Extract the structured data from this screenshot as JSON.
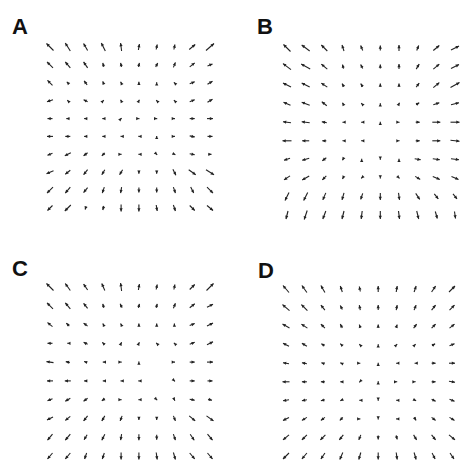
{
  "figure": {
    "panels": [
      {
        "id": "A",
        "label": "A"
      },
      {
        "id": "B",
        "label": "B"
      },
      {
        "id": "C",
        "label": "C"
      },
      {
        "id": "D",
        "label": "D"
      }
    ],
    "arrow_color": "#222222"
  },
  "chart_data": [
    {
      "type": "quiver",
      "title": "A",
      "grid": {
        "rows": 10,
        "cols": 10
      },
      "layout": {
        "label_x": 12,
        "label_y": 16,
        "x0": 50,
        "x1": 210,
        "y0": 47,
        "y1": 208
      },
      "u": [
        [
          -7,
          -5,
          -4,
          -4,
          -1,
          1,
          1,
          1,
          6,
          8
        ],
        [
          -6,
          -5,
          -4,
          -1,
          -1,
          1,
          2,
          2,
          5,
          5
        ],
        [
          -5,
          -2,
          -3,
          -1,
          -1,
          0,
          0,
          -1,
          5,
          5
        ],
        [
          -6,
          -1,
          -4,
          1,
          -1,
          1,
          -1,
          -1,
          5,
          5
        ],
        [
          -5,
          -3,
          -3,
          -2,
          1,
          1,
          1,
          1,
          5,
          6
        ],
        [
          -6,
          -5,
          -3,
          -2,
          -1,
          -1,
          0,
          1,
          5,
          5
        ],
        [
          -5,
          -6,
          -4,
          -3,
          1,
          -1,
          1,
          2,
          5,
          3
        ],
        [
          -7,
          -5,
          -4,
          -3,
          -3,
          0,
          0,
          3,
          7,
          8
        ],
        [
          -6,
          -5,
          -4,
          -2,
          -1,
          0,
          0,
          2,
          3,
          6
        ],
        [
          -5,
          -6,
          -1,
          -1,
          0,
          0,
          1,
          2,
          5,
          6
        ]
      ],
      "v": [
        [
          7,
          8,
          7,
          8,
          8,
          6,
          5,
          5,
          5,
          7
        ],
        [
          6,
          6,
          6,
          4,
          4,
          4,
          4,
          5,
          4,
          2
        ],
        [
          5,
          2,
          4,
          3,
          2,
          2,
          1,
          1,
          2,
          3
        ],
        [
          -2,
          1,
          2,
          1,
          2,
          2,
          1,
          1,
          2,
          3
        ],
        [
          0,
          0,
          0,
          0,
          1,
          0,
          0,
          0,
          0,
          0
        ],
        [
          0,
          0,
          0,
          0,
          0,
          0,
          1,
          0,
          -1,
          0
        ],
        [
          -2,
          -3,
          -3,
          -3,
          0,
          0,
          -1,
          -1,
          -1,
          0
        ],
        [
          -3,
          -4,
          -5,
          -5,
          -5,
          -3,
          -3,
          -6,
          -5,
          -5
        ],
        [
          -6,
          -6,
          -5,
          -6,
          -6,
          -5,
          -5,
          -6,
          -6,
          -6
        ],
        [
          -5,
          -6,
          -3,
          -4,
          -7,
          -7,
          -6,
          -6,
          -5,
          -5
        ]
      ]
    },
    {
      "type": "quiver",
      "title": "B",
      "grid": {
        "rows": 10,
        "cols": 10
      },
      "layout": {
        "label_x": 257,
        "label_y": 16,
        "x0": 287,
        "x1": 455,
        "y0": 48,
        "y1": 215
      },
      "u": [
        [
          -7,
          -8,
          -6,
          -2,
          -2,
          0,
          0,
          2,
          6,
          8
        ],
        [
          -8,
          -9,
          -6,
          -1,
          -2,
          0,
          0,
          3,
          6,
          8
        ],
        [
          -8,
          -8,
          -6,
          -2,
          -2,
          0,
          0,
          3,
          6,
          9
        ],
        [
          -7,
          -8,
          -5,
          -1,
          -1,
          0,
          1,
          3,
          6,
          8
        ],
        [
          -8,
          -8,
          -5,
          -1,
          -1,
          0,
          1,
          4,
          8,
          9
        ],
        [
          -9,
          -7,
          -4,
          -1,
          -1,
          0,
          1,
          4,
          8,
          9
        ],
        [
          -6,
          -7,
          -4,
          -1,
          0,
          0,
          0,
          6,
          7,
          8
        ],
        [
          -6,
          -7,
          -4,
          -1,
          -1,
          0,
          1,
          5,
          7,
          7
        ],
        [
          -4,
          -4,
          -3,
          -2,
          -2,
          0,
          1,
          4,
          4,
          4
        ],
        [
          -2,
          -3,
          -3,
          -2,
          -1,
          0,
          1,
          2,
          2,
          1
        ]
      ],
      "v": [
        [
          7,
          6,
          6,
          6,
          5,
          5,
          6,
          5,
          5,
          4
        ],
        [
          6,
          5,
          5,
          4,
          4,
          4,
          5,
          5,
          5,
          4
        ],
        [
          4,
          4,
          4,
          3,
          3,
          3,
          3,
          4,
          5,
          5
        ],
        [
          3,
          3,
          4,
          2,
          1,
          1,
          2,
          2,
          2,
          2
        ],
        [
          1,
          1,
          1,
          0,
          0,
          1,
          0,
          0,
          0,
          0
        ],
        [
          0,
          0,
          0,
          0,
          0,
          0,
          0,
          0,
          0,
          -1
        ],
        [
          -2,
          -2,
          -3,
          -2,
          1,
          -1,
          1,
          -1,
          -1,
          -1
        ],
        [
          -4,
          -4,
          -4,
          -2,
          -1,
          -1,
          -1,
          -3,
          -3,
          -3
        ],
        [
          -8,
          -8,
          -7,
          -7,
          -6,
          -7,
          -7,
          -6,
          -5,
          -5
        ],
        [
          -8,
          -9,
          -8,
          -8,
          -8,
          -8,
          -8,
          -8,
          -7,
          -7
        ]
      ]
    },
    {
      "type": "quiver",
      "title": "C",
      "grid": {
        "rows": 10,
        "cols": 10
      },
      "layout": {
        "label_x": 12,
        "label_y": 258,
        "x0": 50,
        "x1": 210,
        "y0": 287,
        "y1": 456
      },
      "u": [
        [
          -7,
          -5,
          -4,
          -3,
          -1,
          1,
          1,
          1,
          5,
          7
        ],
        [
          -6,
          -5,
          -4,
          -1,
          -2,
          1,
          1,
          2,
          5,
          6
        ],
        [
          -5,
          -3,
          -4,
          -1,
          -1,
          0,
          0,
          0,
          5,
          6
        ],
        [
          -5,
          -1,
          -4,
          -2,
          1,
          1,
          -1,
          -1,
          5,
          6
        ],
        [
          -7,
          -4,
          -3,
          -1,
          1,
          0,
          0,
          1,
          5,
          6
        ],
        [
          -6,
          -6,
          -3,
          -1,
          -1,
          -1,
          0,
          1,
          5,
          5
        ],
        [
          -5,
          -5,
          -4,
          -3,
          1,
          -1,
          1,
          1,
          5,
          4
        ],
        [
          -6,
          -5,
          -4,
          -3,
          -2,
          0,
          0,
          2,
          6,
          7
        ],
        [
          -5,
          -5,
          -3,
          -3,
          -1,
          0,
          0,
          2,
          4,
          5
        ],
        [
          -5,
          -5,
          -2,
          -2,
          0,
          0,
          1,
          2,
          5,
          5
        ]
      ],
      "v": [
        [
          7,
          7,
          6,
          7,
          8,
          6,
          5,
          5,
          5,
          7
        ],
        [
          6,
          6,
          5,
          4,
          4,
          4,
          4,
          5,
          4,
          3
        ],
        [
          4,
          3,
          3,
          2,
          2,
          2,
          2,
          2,
          2,
          3
        ],
        [
          0,
          0,
          2,
          2,
          2,
          2,
          1,
          1,
          2,
          3
        ],
        [
          1,
          1,
          1,
          0,
          0,
          1,
          0,
          0,
          0,
          0
        ],
        [
          0,
          0,
          0,
          0,
          0,
          0,
          0,
          -1,
          0,
          0
        ],
        [
          -2,
          -3,
          -3,
          -2,
          0,
          0,
          -1,
          -2,
          -1,
          -1
        ],
        [
          -3,
          -4,
          -5,
          -5,
          -5,
          -3,
          -3,
          -5,
          -5,
          -5
        ],
        [
          -6,
          -6,
          -5,
          -6,
          -6,
          -6,
          -5,
          -6,
          -6,
          -6
        ],
        [
          -6,
          -6,
          -6,
          -6,
          -7,
          -7,
          -7,
          -7,
          -6,
          -6
        ]
      ]
    },
    {
      "type": "quiver",
      "title": "D",
      "grid": {
        "rows": 10,
        "cols": 10
      },
      "layout": {
        "label_x": 258,
        "label_y": 260,
        "x0": 286,
        "x1": 452,
        "y0": 289,
        "y1": 456
      },
      "u": [
        [
          -6,
          -5,
          -4,
          -2,
          -1,
          0,
          1,
          2,
          4,
          6
        ],
        [
          -7,
          -6,
          -4,
          -2,
          -1,
          0,
          1,
          2,
          4,
          5
        ],
        [
          -7,
          -6,
          -4,
          -2,
          -1,
          0,
          1,
          3,
          4,
          5
        ],
        [
          -6,
          -5,
          -3,
          -2,
          -1,
          0,
          1,
          1,
          3,
          5
        ],
        [
          -6,
          -5,
          -3,
          -2,
          1,
          0,
          -1,
          -1,
          4,
          6
        ],
        [
          -7,
          -5,
          -4,
          -2,
          -1,
          0,
          1,
          1,
          4,
          6
        ],
        [
          -6,
          -5,
          -4,
          -2,
          -1,
          0,
          -1,
          2,
          4,
          5
        ],
        [
          -6,
          -5,
          -4,
          -3,
          1,
          0,
          -1,
          2,
          4,
          5
        ],
        [
          -6,
          -5,
          -5,
          -4,
          -2,
          0,
          1,
          3,
          4,
          6
        ],
        [
          -6,
          -5,
          -4,
          -3,
          -2,
          0,
          1,
          2,
          3,
          4
        ]
      ],
      "v": [
        [
          7,
          7,
          7,
          6,
          5,
          6,
          6,
          6,
          6,
          6
        ],
        [
          6,
          6,
          5,
          4,
          5,
          5,
          5,
          5,
          5,
          5
        ],
        [
          4,
          4,
          4,
          4,
          3,
          3,
          3,
          4,
          4,
          4
        ],
        [
          3,
          3,
          2,
          2,
          1,
          1,
          1,
          1,
          2,
          2
        ],
        [
          1,
          1,
          1,
          1,
          0,
          1,
          0,
          0,
          0,
          0
        ],
        [
          0,
          0,
          0,
          0,
          -1,
          1,
          0,
          0,
          0,
          -1
        ],
        [
          -1,
          -1,
          -1,
          -1,
          0,
          -1,
          0,
          -1,
          -2,
          -2
        ],
        [
          -3,
          -3,
          -3,
          -3,
          0,
          -1,
          0,
          -3,
          -3,
          -3
        ],
        [
          -5,
          -5,
          -5,
          -5,
          -5,
          -4,
          -4,
          -5,
          -5,
          -5
        ],
        [
          -6,
          -6,
          -6,
          -7,
          -7,
          -7,
          -7,
          -7,
          -6,
          -6
        ]
      ]
    }
  ]
}
